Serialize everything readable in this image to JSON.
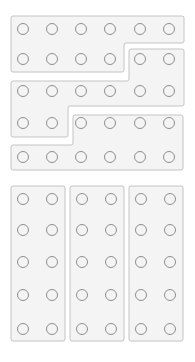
{
  "diagram": {
    "colors": {
      "shape_fill": "#f4f4f4",
      "shape_stroke": "#c4c4c4",
      "circle_stroke": "#8e8e8e"
    },
    "top_group": {
      "rows": 5,
      "cols": 6,
      "circle_x": [
        23,
        52,
        81,
        110,
        140,
        169
      ],
      "circle_y": [
        29,
        59,
        91,
        123,
        157
      ],
      "shapes": [
        {
          "name": "group-1",
          "count": 10
        },
        {
          "name": "group-2",
          "count": 10
        },
        {
          "name": "group-3",
          "count": 10
        }
      ]
    },
    "bottom_group": {
      "rows": 5,
      "cols": 6,
      "circle_x": [
        23,
        52,
        82,
        111,
        141,
        170
      ],
      "circle_y": [
        199,
        230,
        262,
        295,
        329
      ],
      "shapes": [
        {
          "name": "column-1",
          "count": 10
        },
        {
          "name": "column-2",
          "count": 10
        },
        {
          "name": "column-3",
          "count": 10
        }
      ]
    }
  }
}
